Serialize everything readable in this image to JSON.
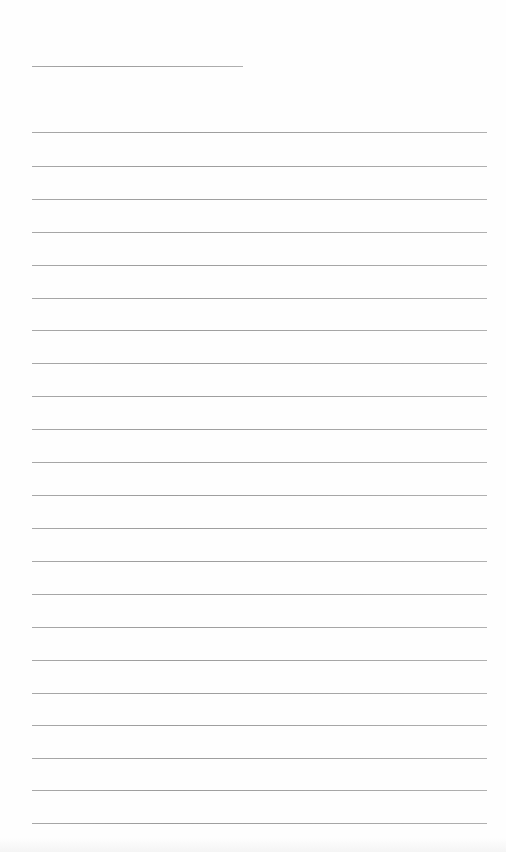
{
  "document": {
    "type": "ruled-paper",
    "background_color": "#fefefe",
    "line_color": "#a0a0a0",
    "header_line": {
      "top": 66,
      "left": 32,
      "width": 211
    },
    "ruled_lines": {
      "left": 32,
      "width": 455,
      "tops": [
        132,
        166,
        199,
        232,
        265,
        298,
        330,
        363,
        396,
        429,
        462,
        495,
        528,
        561,
        594,
        627,
        660,
        693,
        725,
        758,
        790,
        823
      ]
    },
    "text_content": ""
  }
}
